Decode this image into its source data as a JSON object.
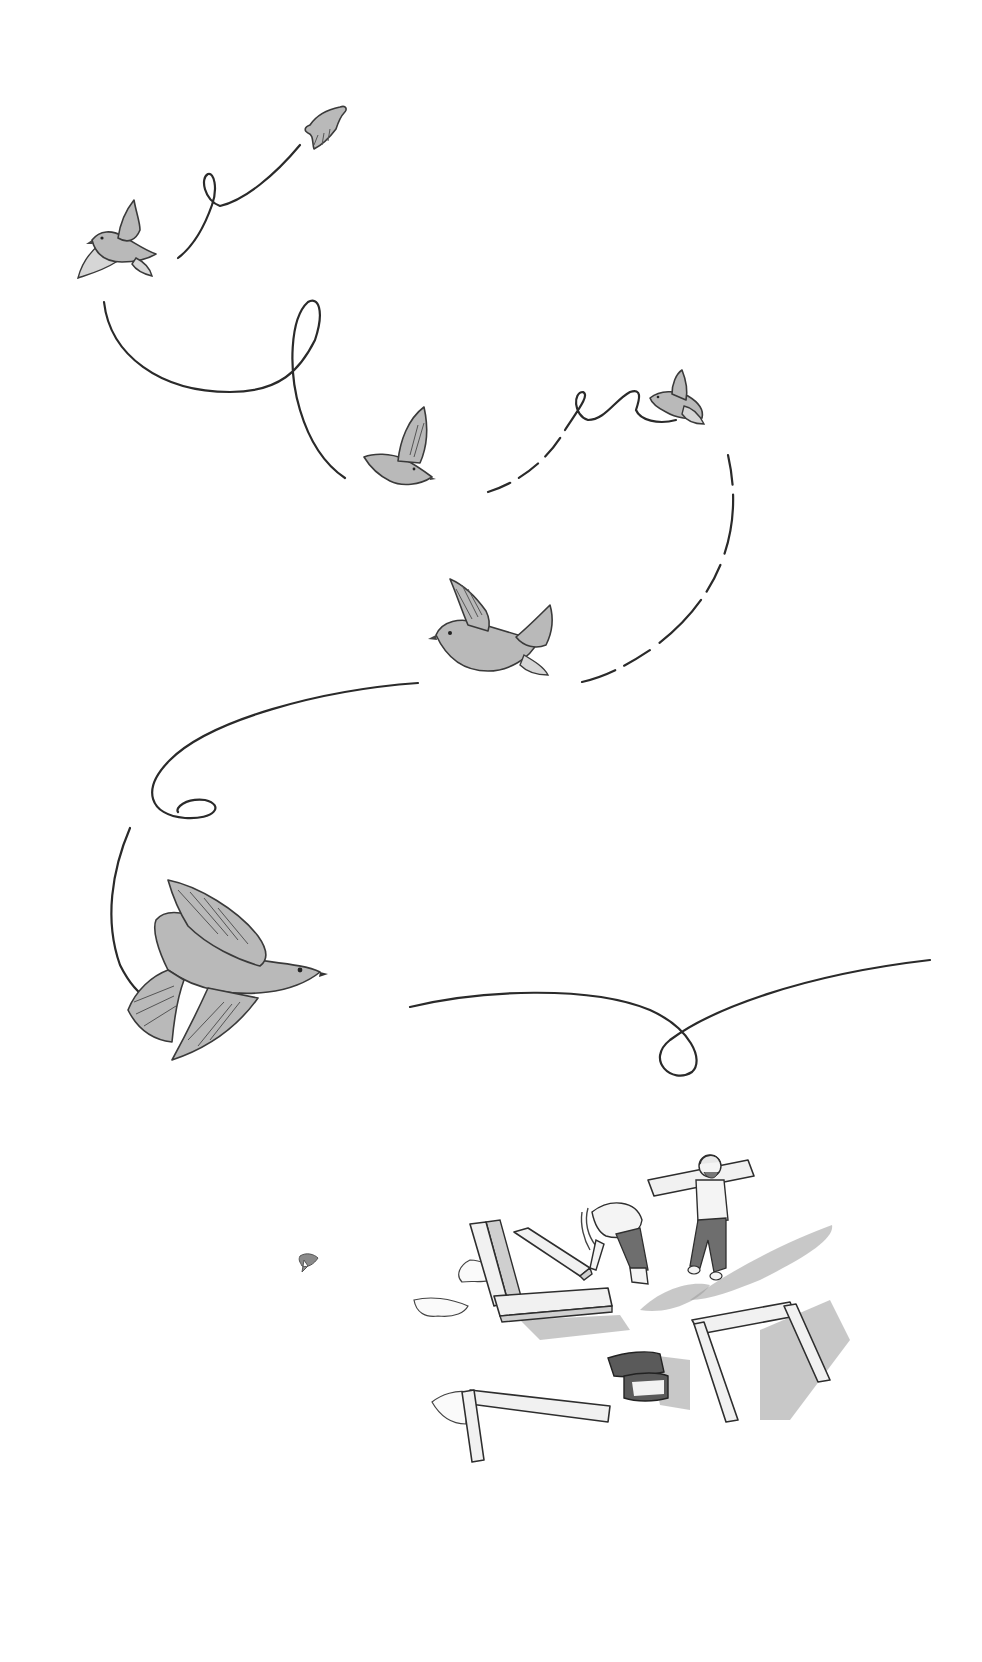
{
  "scene": {
    "title": "Birds in looping flight above workers laying stone blocks",
    "style": "grayscale pencil and watercolor illustration",
    "background_color": "#ffffff",
    "ink_color": "#2a2a2a",
    "bird_fill": "#b9b9b9",
    "elements": {
      "birds": [
        {
          "id": "bird-1",
          "position": "top-center",
          "size": "small"
        },
        {
          "id": "bird-2",
          "position": "top-left",
          "size": "small"
        },
        {
          "id": "bird-3",
          "position": "upper-middle",
          "size": "small"
        },
        {
          "id": "bird-4",
          "position": "upper-right",
          "size": "small"
        },
        {
          "id": "bird-5",
          "position": "middle",
          "size": "medium"
        },
        {
          "id": "bird-6",
          "position": "lower-left",
          "size": "large"
        },
        {
          "id": "bird-7",
          "position": "lower-left-tiny",
          "size": "tiny"
        }
      ],
      "flight_paths": 8,
      "workers": [
        {
          "id": "worker-bending",
          "description": "long-haired person bending to place a stone beam"
        },
        {
          "id": "worker-carrying",
          "description": "bearded man in cap carrying a beam on his shoulder"
        }
      ],
      "stones": [
        "L-shaped beams",
        "angled beam",
        "rectangular frame",
        "lower-left beam"
      ],
      "sacks": 2
    }
  }
}
